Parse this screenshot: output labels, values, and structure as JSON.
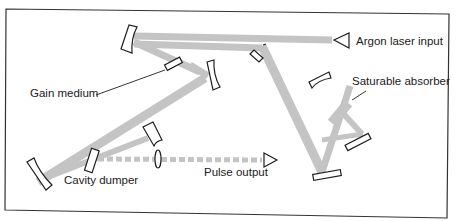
{
  "diagram": {
    "type": "optical-schematic",
    "colors": {
      "beam": "#c4c4c4",
      "outline": "#1e1e1e",
      "background": "#ffffff",
      "text": "#1a1a1a"
    },
    "labels": {
      "argon_input": "Argon laser input",
      "gain_medium": "Gain medium",
      "saturable_absorber": "Saturable absorber",
      "cavity_dumper": "Cavity dumper",
      "pulse_output": "Pulse output"
    },
    "components": [
      {
        "id": "input-arrow",
        "label": "Argon laser input"
      },
      {
        "id": "gain-medium",
        "label": "Gain medium"
      },
      {
        "id": "saturable-absorber",
        "label": "Saturable absorber"
      },
      {
        "id": "cavity-dumper",
        "label": "Cavity dumper"
      },
      {
        "id": "output-arrow",
        "label": "Pulse output"
      }
    ]
  }
}
